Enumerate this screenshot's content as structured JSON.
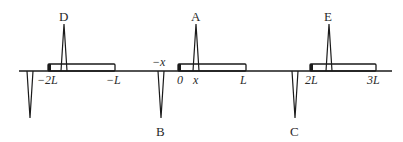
{
  "diagram": {
    "type": "image-charge periodic layout",
    "axis": {
      "x_start": 19,
      "x_end": 392,
      "y": 71
    },
    "rectangles": [
      {
        "name": "rod-neg",
        "x0": 48,
        "x1": 115,
        "from_label": "-2L",
        "to_label": "-L"
      },
      {
        "name": "rod-main",
        "x0": 178,
        "x1": 246,
        "from_label": "0",
        "to_label": "L"
      },
      {
        "name": "rod-pos",
        "x0": 310,
        "x1": 376,
        "from_label": "2L",
        "to_label": "3L"
      }
    ],
    "spikes": [
      {
        "label": "D",
        "x": 64,
        "direction": "up"
      },
      {
        "label": "",
        "x": 30,
        "direction": "down"
      },
      {
        "label": "A",
        "x": 196,
        "direction": "up"
      },
      {
        "label": "B",
        "x": 161,
        "direction": "down"
      },
      {
        "label": "E",
        "x": 329,
        "direction": "up"
      },
      {
        "label": "C",
        "x": 295,
        "direction": "down"
      }
    ],
    "point_labels": {
      "A": "A",
      "B": "B",
      "C": "C",
      "D": "D",
      "E": "E"
    },
    "tick_labels": {
      "neg2L": "−2L",
      "negL": "−L",
      "negx": "−x",
      "zero": "0",
      "x": "x",
      "L": "L",
      "twoL": "2L",
      "threeL": "3L"
    },
    "colors": {
      "stroke": "#1a1a1a",
      "background": "#ffffff"
    }
  }
}
